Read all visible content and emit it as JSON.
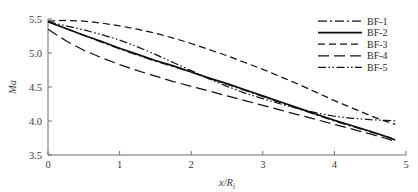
{
  "chart_data": {
    "type": "line",
    "title": "",
    "xlabel": "x/R i",
    "xlabel_main": "x/R",
    "xlabel_sub": "i",
    "ylabel": "Ma",
    "xlim": [
      0,
      5
    ],
    "ylim": [
      3.5,
      5.5
    ],
    "xticks": [
      0,
      1,
      2,
      3,
      4,
      5
    ],
    "xtick_labels": [
      "0",
      "1",
      "2",
      "3",
      "4",
      "5"
    ],
    "yticks": [
      3.5,
      4.0,
      4.5,
      5.0,
      5.5
    ],
    "ytick_labels": [
      "3.5",
      "4.0",
      "4.5",
      "5.0",
      "5.5"
    ],
    "grid": false,
    "legend_position": "upper-right",
    "series": [
      {
        "name": "BF-1",
        "style": "dash-dot",
        "dasharray": "9,3,2,3",
        "x": [
          0,
          0.25,
          0.5,
          0.75,
          1.0,
          1.25,
          1.5,
          1.75,
          2.0,
          2.25,
          2.5,
          2.75,
          3.0,
          3.25,
          3.5,
          3.75,
          4.0,
          4.25,
          4.5,
          4.7,
          4.8
        ],
        "y": [
          5.46,
          5.36,
          5.26,
          5.16,
          5.06,
          4.97,
          4.88,
          4.8,
          4.72,
          4.63,
          4.54,
          4.45,
          4.36,
          4.27,
          4.18,
          4.09,
          4.0,
          3.92,
          3.84,
          3.78,
          3.75
        ]
      },
      {
        "name": "BF-2",
        "style": "solid",
        "dasharray": "none",
        "x": [
          0,
          0.25,
          0.5,
          0.75,
          1.0,
          1.25,
          1.5,
          1.75,
          2.0,
          2.25,
          2.5,
          2.75,
          3.0,
          3.25,
          3.5,
          3.75,
          4.0,
          4.25,
          4.5,
          4.7,
          4.85
        ],
        "y": [
          5.46,
          5.36,
          5.26,
          5.17,
          5.07,
          4.98,
          4.89,
          4.81,
          4.72,
          4.63,
          4.55,
          4.46,
          4.37,
          4.28,
          4.19,
          4.1,
          4.01,
          3.93,
          3.85,
          3.78,
          3.72
        ]
      },
      {
        "name": "BF-3",
        "style": "dashed-short",
        "dasharray": "7,4",
        "x": [
          0,
          0.25,
          0.5,
          0.75,
          1.0,
          1.25,
          1.5,
          1.75,
          2.0,
          2.25,
          2.5,
          2.75,
          3.0,
          3.25,
          3.5,
          3.75,
          4.0,
          4.25,
          4.5,
          4.7,
          4.85
        ],
        "y": [
          5.47,
          5.48,
          5.47,
          5.44,
          5.4,
          5.35,
          5.29,
          5.22,
          5.14,
          5.05,
          4.96,
          4.86,
          4.76,
          4.65,
          4.54,
          4.42,
          4.3,
          4.19,
          4.08,
          4.0,
          3.95
        ]
      },
      {
        "name": "BF-4",
        "style": "dashed-long",
        "dasharray": "11,5",
        "x": [
          0,
          0.25,
          0.5,
          0.75,
          1.0,
          1.25,
          1.5,
          1.75,
          2.0,
          2.25,
          2.5,
          2.75,
          3.0,
          3.25,
          3.5,
          3.75,
          4.0,
          4.25,
          4.5,
          4.7,
          4.85
        ],
        "y": [
          5.35,
          5.18,
          5.04,
          4.93,
          4.83,
          4.74,
          4.66,
          4.58,
          4.51,
          4.44,
          4.37,
          4.3,
          4.23,
          4.16,
          4.09,
          4.02,
          3.95,
          3.88,
          3.81,
          3.75,
          3.7
        ]
      },
      {
        "name": "BF-5",
        "style": "dash-dot-dot",
        "dasharray": "8,2.5,1.5,2.5,1.5,2.5",
        "x": [
          0,
          0.25,
          0.5,
          0.75,
          1.0,
          1.25,
          1.5,
          1.75,
          2.0,
          2.25,
          2.5,
          2.75,
          3.0,
          3.25,
          3.5,
          3.75,
          4.0,
          4.25,
          4.5,
          4.7,
          4.85
        ],
        "y": [
          5.46,
          5.4,
          5.34,
          5.27,
          5.19,
          5.09,
          4.98,
          4.86,
          4.74,
          4.62,
          4.51,
          4.41,
          4.33,
          4.25,
          4.18,
          4.12,
          4.07,
          4.04,
          4.02,
          4.01,
          4.0
        ]
      }
    ]
  },
  "legend": {
    "items": [
      {
        "label": "BF-1"
      },
      {
        "label": "BF-2"
      },
      {
        "label": "BF-3"
      },
      {
        "label": "BF-4"
      },
      {
        "label": "BF-5"
      }
    ]
  }
}
